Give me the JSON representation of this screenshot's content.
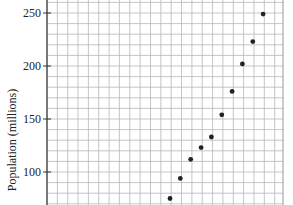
{
  "chart_data": {
    "type": "scatter",
    "title": "",
    "xlabel": "",
    "ylabel": "Population (millions)",
    "ylim": [
      68,
      258
    ],
    "yticks": [
      100,
      150,
      200,
      250
    ],
    "grid": true,
    "grid_minor_step_y": 10,
    "legend": null,
    "x_index": [
      0,
      1,
      2,
      3,
      4,
      5,
      6,
      7,
      8,
      9
    ],
    "values": [
      75,
      94,
      112,
      123,
      133,
      154,
      176,
      202,
      223,
      249
    ],
    "point_color": "#222222"
  },
  "axis": {
    "y_label": "Population (millions)",
    "y_ticks": [
      "250",
      "200",
      "150",
      "100"
    ]
  }
}
